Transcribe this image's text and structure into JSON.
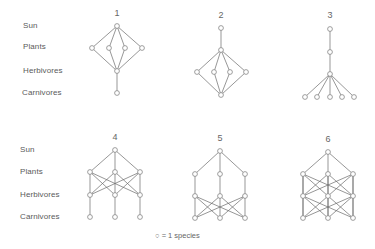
{
  "figure": {
    "row_labels_top": [
      "Sun",
      "Plants",
      "Herbivores",
      "Carnivores"
    ],
    "row_labels_bottom": [
      "Sun",
      "Plants",
      "Herbivores",
      "Carnivores"
    ],
    "legend": {
      "symbol": "○",
      "text": "= 1 species"
    },
    "webs": [
      {
        "id": "1",
        "label": "1",
        "x": 117,
        "y": 14
      },
      {
        "id": "2",
        "label": "2",
        "x": 221,
        "y": 16
      },
      {
        "id": "3",
        "label": "3",
        "x": 330,
        "y": 16
      },
      {
        "id": "4",
        "label": "4",
        "x": 115,
        "y": 138
      },
      {
        "id": "5",
        "label": "5",
        "x": 220,
        "y": 139
      },
      {
        "id": "6",
        "label": "6",
        "x": 328,
        "y": 140
      }
    ]
  },
  "diagram": {
    "nodes": {
      "w1": [
        [
          117,
          26
        ],
        [
          92,
          48
        ],
        [
          109,
          48
        ],
        [
          125,
          48
        ],
        [
          142,
          48
        ],
        [
          117,
          71
        ],
        [
          117,
          93
        ]
      ],
      "w2": [
        [
          221,
          28
        ],
        [
          221,
          50
        ],
        [
          197,
          72
        ],
        [
          214,
          72
        ],
        [
          230,
          72
        ],
        [
          246,
          72
        ],
        [
          221,
          95
        ]
      ],
      "w3": [
        [
          330,
          29
        ],
        [
          330,
          52
        ],
        [
          330,
          74
        ],
        [
          305,
          97
        ],
        [
          317,
          97
        ],
        [
          330,
          97
        ],
        [
          342,
          97
        ],
        [
          354,
          97
        ]
      ],
      "w4": [
        [
          115,
          150
        ],
        [
          90,
          172
        ],
        [
          115,
          172
        ],
        [
          140,
          172
        ],
        [
          90,
          195
        ],
        [
          115,
          195
        ],
        [
          140,
          195
        ],
        [
          90,
          217
        ],
        [
          115,
          217
        ],
        [
          140,
          217
        ]
      ],
      "w5": [
        [
          220,
          151
        ],
        [
          195,
          174
        ],
        [
          220,
          174
        ],
        [
          245,
          174
        ],
        [
          195,
          196
        ],
        [
          220,
          196
        ],
        [
          245,
          196
        ],
        [
          195,
          218
        ],
        [
          220,
          218
        ],
        [
          245,
          218
        ]
      ],
      "w6": [
        [
          328,
          152
        ],
        [
          303,
          174
        ],
        [
          328,
          174
        ],
        [
          353,
          174
        ],
        [
          303,
          196
        ],
        [
          328,
          196
        ],
        [
          353,
          196
        ],
        [
          303,
          218
        ],
        [
          328,
          218
        ],
        [
          353,
          218
        ]
      ]
    },
    "edges": {
      "w1": [
        [
          0,
          1
        ],
        [
          0,
          2
        ],
        [
          0,
          3
        ],
        [
          0,
          4
        ],
        [
          1,
          5
        ],
        [
          2,
          5
        ],
        [
          3,
          5
        ],
        [
          4,
          5
        ],
        [
          5,
          6
        ]
      ],
      "w2": [
        [
          0,
          1
        ],
        [
          1,
          2
        ],
        [
          1,
          3
        ],
        [
          1,
          4
        ],
        [
          1,
          5
        ],
        [
          2,
          6
        ],
        [
          3,
          6
        ],
        [
          4,
          6
        ],
        [
          5,
          6
        ]
      ],
      "w3": [
        [
          0,
          1
        ],
        [
          1,
          2
        ],
        [
          2,
          3
        ],
        [
          2,
          4
        ],
        [
          2,
          5
        ],
        [
          2,
          6
        ],
        [
          2,
          7
        ]
      ],
      "w4": [
        [
          0,
          1
        ],
        [
          0,
          2
        ],
        [
          0,
          3
        ],
        [
          1,
          4
        ],
        [
          1,
          5
        ],
        [
          1,
          6
        ],
        [
          2,
          4
        ],
        [
          2,
          5
        ],
        [
          2,
          6
        ],
        [
          3,
          4
        ],
        [
          3,
          5
        ],
        [
          3,
          6
        ],
        [
          4,
          7
        ],
        [
          5,
          8
        ],
        [
          6,
          9
        ]
      ],
      "w5": [
        [
          0,
          1
        ],
        [
          0,
          2
        ],
        [
          0,
          3
        ],
        [
          1,
          4
        ],
        [
          2,
          5
        ],
        [
          3,
          6
        ],
        [
          4,
          7
        ],
        [
          4,
          8
        ],
        [
          4,
          9
        ],
        [
          5,
          7
        ],
        [
          5,
          8
        ],
        [
          5,
          9
        ],
        [
          6,
          7
        ],
        [
          6,
          8
        ],
        [
          6,
          9
        ]
      ],
      "w6": [
        [
          0,
          1
        ],
        [
          0,
          2
        ],
        [
          0,
          3
        ],
        [
          1,
          4
        ],
        [
          1,
          5
        ],
        [
          1,
          6
        ],
        [
          2,
          4
        ],
        [
          2,
          5
        ],
        [
          2,
          6
        ],
        [
          3,
          4
        ],
        [
          3,
          5
        ],
        [
          3,
          6
        ],
        [
          4,
          7
        ],
        [
          4,
          8
        ],
        [
          4,
          9
        ],
        [
          5,
          7
        ],
        [
          5,
          8
        ],
        [
          5,
          9
        ],
        [
          6,
          7
        ],
        [
          6,
          8
        ],
        [
          6,
          9
        ],
        [
          1,
          7
        ],
        [
          3,
          9
        ],
        [
          2,
          8
        ]
      ]
    },
    "colors": {
      "line": "#6a6a6a",
      "node_fill": "#ffffff",
      "node_stroke": "#777777"
    }
  }
}
